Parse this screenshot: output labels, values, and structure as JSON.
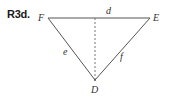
{
  "problem_label": "R3d.",
  "diagram": {
    "type": "triangle",
    "vertices": [
      {
        "name": "F",
        "x": 48,
        "y": 18
      },
      {
        "name": "E",
        "x": 150,
        "y": 18
      },
      {
        "name": "D",
        "x": 95,
        "y": 80
      }
    ],
    "sides": [
      {
        "label": "d",
        "from": "F",
        "to": "E"
      },
      {
        "label": "e",
        "from": "F",
        "to": "D"
      },
      {
        "label": "f",
        "from": "E",
        "to": "D"
      }
    ],
    "altitude": {
      "from": "D",
      "to": "FE",
      "style": "dashed"
    },
    "labels": {
      "F": "F",
      "E": "E",
      "D": "D",
      "d": "d",
      "e": "e",
      "f": "f"
    },
    "colors": {
      "line": "#555555",
      "text": "#333333"
    }
  }
}
